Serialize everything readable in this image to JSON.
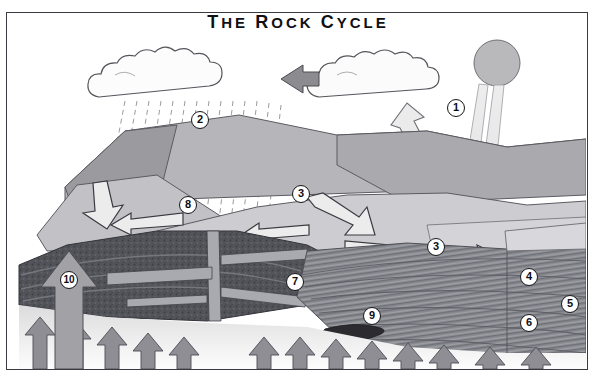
{
  "diagram": {
    "title_html": "THE ROCK CYCLE",
    "title_parts": [
      "T",
      "HE ",
      "R",
      "OCK ",
      "C",
      "YCLE"
    ],
    "caption": "Heat from interior of earth",
    "frame_color": "#3a3a40",
    "background": "#ffffff"
  },
  "labels": [
    {
      "id": "1",
      "text": "1",
      "x": 449,
      "y": 86,
      "describes": "evaporation-from-ocean-and-solar-energy"
    },
    {
      "id": "2",
      "text": "2",
      "x": 193,
      "y": 98,
      "describes": "precipitation-rainfall"
    },
    {
      "id": "3a",
      "text": "3",
      "x": 294,
      "y": 172,
      "describes": "erosion-and-transport-of-sediment"
    },
    {
      "id": "3b",
      "text": "3",
      "x": 429,
      "y": 225,
      "describes": "transport-of-sediment-to-sea"
    },
    {
      "id": "4",
      "text": "4",
      "x": 522,
      "y": 255,
      "describes": "deposition-of-sediment"
    },
    {
      "id": "5",
      "text": "5",
      "x": 563,
      "y": 282,
      "describes": "burial-compaction"
    },
    {
      "id": "6",
      "text": "6",
      "x": 522,
      "y": 301,
      "describes": "sedimentary-rock-layers"
    },
    {
      "id": "7",
      "text": "7",
      "x": 288,
      "y": 260,
      "describes": "metamorphic-rock"
    },
    {
      "id": "8",
      "text": "8",
      "x": 181,
      "y": 183,
      "describes": "igneous-intrusion-dike"
    },
    {
      "id": "9",
      "text": "9",
      "x": 365,
      "y": 294,
      "describes": "magma-body"
    },
    {
      "id": "10",
      "text": "10",
      "x": 62,
      "y": 258,
      "describes": "uplift-of-rock"
    }
  ],
  "elements": {
    "sun": {
      "name": "sun",
      "fill": "#b9b9bc"
    },
    "sun_beam": {
      "name": "solar-radiation-beam",
      "fill": "#e6e6e8"
    },
    "cloud_left": {
      "name": "rain-cloud",
      "fill": "#fcfcfc"
    },
    "cloud_right": {
      "name": "cloud",
      "fill": "#fbfbfb"
    },
    "cloud_arrow": {
      "name": "cloud-transport-arrow",
      "fill": "#8c8c90"
    },
    "rain": {
      "name": "rainfall-dashes",
      "stroke": "#8e8e93"
    },
    "evaporation_arrow": {
      "name": "evaporation-arrow",
      "fill": "#ebebec"
    },
    "heat_arrows": {
      "name": "heat-arrows",
      "fill": "#8e8e94",
      "count": 13
    },
    "uplift_arrow": {
      "name": "uplift-arrow",
      "fill": "#a2a2a6"
    },
    "erosion_arrows": {
      "name": "erosion-arrows",
      "fill": "#e9e9ea"
    },
    "deposition_arrow": {
      "name": "deposition-arrow",
      "fill": "#e9e9ea"
    },
    "mountains": {
      "name": "mountain-landform",
      "fill_light": "#cfcfd2",
      "fill_mid": "#b3b3b7",
      "fill_dark": "#9a9a9f"
    },
    "dark_rock": {
      "name": "metamorphic-rock-mass",
      "fill": "#55555b"
    },
    "strata": {
      "name": "sedimentary-strata",
      "fill": "#8a8a90"
    },
    "magma": {
      "name": "magma-intrusion",
      "fill": "#2b2b30"
    },
    "mantle": {
      "name": "earth-interior",
      "fill": "#efefef"
    }
  }
}
